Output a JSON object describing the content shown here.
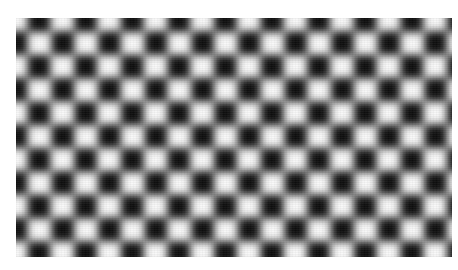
{
  "image": {
    "subject": "Blurred checkerboard pattern photograph",
    "description": "Grayscale photo of a low-pass filtered (blurred) checkerboard with alternating light and dark squares",
    "pattern": {
      "columns_visible": 19,
      "rows_visible": 11,
      "cell_size_px": 23.3,
      "light_color": "#e8e8e8",
      "dark_color": "#1c1c1c",
      "background_color": "#ffffff"
    }
  }
}
